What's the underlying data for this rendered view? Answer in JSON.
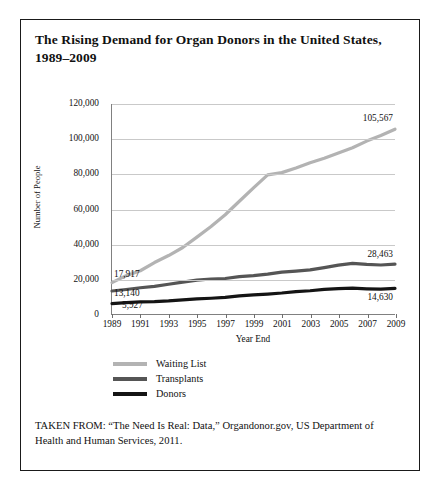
{
  "figure": {
    "title": "The Rising Demand for Organ Donors in the United States, 1989–2009",
    "source_note": "TAKEN FROM: “The Need Is Real: Data,” Organdonor.gov, US Department of Health and Human Services, 2011."
  },
  "chart_data": {
    "type": "line",
    "title": "The Rising Demand for Organ Donors in the United States, 1989–2009",
    "xlabel": "Year End",
    "ylabel": "Number of People",
    "xlim": [
      1989,
      2009
    ],
    "ylim": [
      0,
      120000
    ],
    "grid": true,
    "legend_position": "below-left",
    "categories": [
      1989,
      1990,
      1991,
      1992,
      1993,
      1994,
      1995,
      1996,
      1997,
      1998,
      1999,
      2000,
      2001,
      2002,
      2003,
      2004,
      2005,
      2006,
      2007,
      2008,
      2009
    ],
    "tick_labels_x": [
      "1989",
      "1991",
      "1993",
      "1995",
      "1997",
      "1999",
      "2001",
      "2003",
      "2005",
      "2007",
      "2009"
    ],
    "tick_labels_y": [
      "0",
      "20,000",
      "40,000",
      "60,000",
      "80,000",
      "100,000",
      "120,000"
    ],
    "tick_values_y": [
      0,
      20000,
      40000,
      60000,
      80000,
      100000,
      120000
    ],
    "series": [
      {
        "name": "Waiting List",
        "color": "#b3b3b3",
        "values": [
          17917,
          21914,
          24719,
          29415,
          33394,
          38000,
          43937,
          50000,
          56716,
          64423,
          72110,
          79523,
          80790,
          83400,
          86400,
          89000,
          92000,
          95000,
          98800,
          102000,
          105567
        ],
        "label_start": "17,917",
        "label_end": "105,567"
      },
      {
        "name": "Transplants",
        "color": "#555555",
        "values": [
          13140,
          14000,
          15000,
          15800,
          17000,
          18200,
          19400,
          20000,
          20300,
          21400,
          21900,
          22800,
          23900,
          24500,
          25200,
          26500,
          27900,
          28900,
          28360,
          28000,
          28463
        ],
        "label_start": "13,140",
        "label_end": "28,463"
      },
      {
        "name": "Donors",
        "color": "#141414",
        "values": [
          5927,
          6500,
          6900,
          7100,
          7500,
          8100,
          8600,
          9000,
          9500,
          10400,
          10900,
          11400,
          12000,
          12800,
          13300,
          14100,
          14500,
          14750,
          14400,
          14200,
          14630
        ],
        "label_start": "5,927",
        "label_end": "14,630"
      }
    ]
  }
}
